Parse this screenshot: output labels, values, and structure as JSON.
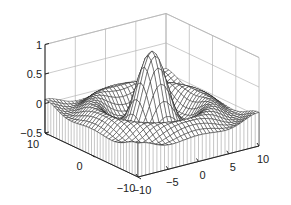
{
  "chart_data": {
    "type": "surface",
    "style": "meshz",
    "function": "sin(r)/r, r = sqrt(x^2 + y^2)",
    "title": "",
    "xlabel": "",
    "ylabel": "",
    "zlabel": "",
    "x_range": [
      -10,
      10
    ],
    "y_range": [
      -10,
      10
    ],
    "zlim": [
      -0.5,
      1
    ],
    "grid": true,
    "mesh_resolution": 33,
    "z_ticks": [
      {
        "value": 1,
        "label": "1"
      },
      {
        "value": 0.5,
        "label": "0.5"
      },
      {
        "value": 0,
        "label": "0"
      },
      {
        "value": -0.5,
        "label": "−0.5"
      }
    ],
    "x_ticks": [
      {
        "value": 10,
        "label": "10"
      },
      {
        "value": 0,
        "label": "0"
      },
      {
        "value": -10,
        "label": "−10"
      }
    ],
    "y_ticks": [
      {
        "value": -10,
        "label": "−10"
      },
      {
        "value": -5,
        "label": "−5"
      },
      {
        "value": 0,
        "label": "0"
      },
      {
        "value": 5,
        "label": "5"
      },
      {
        "value": 10,
        "label": "10"
      }
    ],
    "colors": {
      "mesh_line": "#1a1a1a",
      "mesh_face": "#ffffff",
      "curtain_line": "#8a8a8a",
      "grid": "#b5b5b5",
      "axis": "#222222"
    }
  }
}
